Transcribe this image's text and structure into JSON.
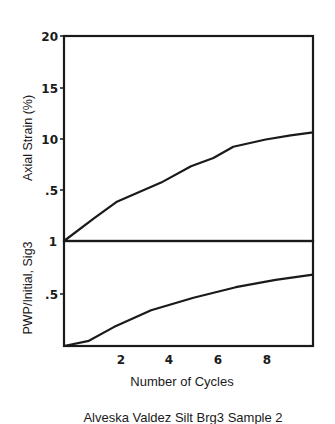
{
  "chart_data": [
    {
      "type": "line",
      "panel": "upper",
      "title": "",
      "xlabel": "",
      "ylabel": "Axial Strain (%)",
      "x": [
        0,
        1.2,
        2.1,
        3.9,
        5.1,
        6.0,
        6.8,
        8.1,
        9.1,
        10.0
      ],
      "series": [
        {
          "name": "Axial Strain",
          "values": [
            0,
            2.2,
            3.8,
            5.7,
            7.3,
            8.1,
            9.2,
            9.9,
            10.3,
            10.6
          ]
        }
      ],
      "ylim": [
        0,
        20
      ],
      "xlim": [
        0,
        10
      ],
      "ytick_labels": [
        "20",
        "15",
        "10",
        ".5"
      ],
      "grid": false
    },
    {
      "type": "line",
      "panel": "lower",
      "title": "",
      "xlabel": "Number of Cycles",
      "ylabel": "PWP/Initial, Sig3",
      "x": [
        0,
        1.0,
        2.0,
        3.5,
        5.2,
        6.9,
        8.5,
        10.0
      ],
      "series": [
        {
          "name": "PWP ratio",
          "values": [
            0,
            0.05,
            0.18,
            0.34,
            0.46,
            0.56,
            0.63,
            0.68
          ]
        }
      ],
      "ylim": [
        0,
        1
      ],
      "xlim": [
        0,
        10
      ],
      "ytick_labels": [
        "1",
        ".5"
      ],
      "xtick_labels": [
        "2",
        "4",
        "6",
        "8"
      ],
      "grid": false
    }
  ],
  "labels": {
    "upper_ylabel": "Axial Strain (%)",
    "lower_ylabel": "PWP/Initial, Sig3",
    "xlabel": "Number of Cycles",
    "caption": "Alveska Valdez Silt Brg3 Sample 2",
    "upper_ticks": [
      "20",
      "15",
      "10",
      ".5"
    ],
    "lower_ticks": [
      "1",
      ".5"
    ],
    "x_ticks": [
      "2",
      "4",
      "6",
      "8"
    ]
  }
}
